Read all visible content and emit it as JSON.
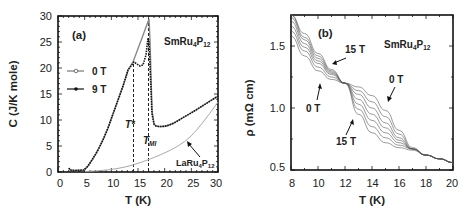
{
  "chart_data": [
    {
      "panel": "(a)",
      "type": "line",
      "xlabel": "T (K)",
      "ylabel": "C (J/K mole)",
      "xlim": [
        0,
        30
      ],
      "ylim": [
        0,
        30
      ],
      "xticks": [
        "0",
        "5",
        "10",
        "15",
        "20",
        "25",
        "30"
      ],
      "yticks": [
        "0",
        "5",
        "10",
        "15",
        "20",
        "25",
        "30"
      ],
      "grid": false,
      "legend_position": "upper-left",
      "compound_label": "SmRu4P12",
      "annotations": [
        "T*",
        "T_MI",
        "LaRu4P12"
      ],
      "vlines": [
        {
          "label": "T*",
          "x": 13.5
        },
        {
          "label": "T_MI",
          "x": 16.5
        }
      ],
      "series": [
        {
          "name": "0 T",
          "marker": "open-circle",
          "x": [
            2,
            3,
            4,
            5,
            6,
            7,
            8,
            9,
            10,
            11,
            12,
            13,
            14,
            15,
            16,
            16.5,
            17,
            18,
            20,
            22,
            24,
            26,
            28,
            30
          ],
          "y": [
            0.8,
            0.6,
            0.6,
            0.8,
            2,
            3.8,
            6,
            8.5,
            11.5,
            15,
            18,
            21,
            23.5,
            26,
            28.5,
            29.5,
            10,
            9,
            10,
            11.5,
            13,
            14.8,
            16.5,
            18.5
          ]
        },
        {
          "name": "9 T",
          "marker": "filled-circle",
          "x": [
            2,
            3,
            4,
            5,
            6,
            7,
            8,
            9,
            10,
            11,
            12,
            13,
            13.5,
            14,
            15,
            16,
            16.5,
            17,
            18,
            20,
            22,
            24,
            26,
            28,
            30
          ],
          "y": [
            0.8,
            0.6,
            0.6,
            0.8,
            2,
            3.8,
            6,
            8.5,
            11.5,
            15,
            18,
            21,
            22,
            21.5,
            21,
            23,
            26.5,
            10,
            9,
            10,
            11.5,
            13,
            14.8,
            16.5,
            18.5
          ]
        },
        {
          "name": "LaRu4P12",
          "marker": "none",
          "x": [
            5,
            10,
            15,
            20,
            25,
            30
          ],
          "y": [
            0.1,
            0.7,
            2.2,
            4.6,
            8.4,
            13.5
          ]
        }
      ]
    },
    {
      "panel": "(b)",
      "type": "line",
      "xlabel": "T (K)",
      "ylabel": "ρ (mΩ cm)",
      "xlim": [
        8,
        20
      ],
      "ylim": [
        0.5,
        1.75
      ],
      "xticks": [
        "8",
        "10",
        "12",
        "14",
        "16",
        "18",
        "20"
      ],
      "yticks": [
        "0.5",
        "1.0",
        "1.5"
      ],
      "grid": false,
      "compound_label": "SmRu4P12",
      "annotations": [
        "15 T",
        "0 T",
        "0 T",
        "15 T"
      ],
      "series_note": "Field sweep from 0 T to 15 T (7 curves)",
      "series": [
        {
          "name": "0 T",
          "x": [
            8,
            9,
            10,
            11,
            12,
            13,
            14,
            15,
            16,
            17,
            18,
            19,
            20
          ],
          "y": [
            1.58,
            1.42,
            1.3,
            1.23,
            1.2,
            1.17,
            1.1,
            0.98,
            0.82,
            0.68,
            0.62,
            0.59,
            0.56
          ]
        },
        {
          "name": "2.5 T",
          "x": [
            8,
            9,
            10,
            11,
            12,
            13,
            14,
            15,
            16,
            17,
            18,
            19,
            20
          ],
          "y": [
            1.62,
            1.46,
            1.33,
            1.25,
            1.2,
            1.14,
            1.05,
            0.93,
            0.79,
            0.67,
            0.62,
            0.59,
            0.56
          ]
        },
        {
          "name": "5 T",
          "x": [
            8,
            9,
            10,
            11,
            12,
            13,
            14,
            15,
            16,
            17,
            18,
            19,
            20
          ],
          "y": [
            1.66,
            1.49,
            1.36,
            1.27,
            1.2,
            1.11,
            1.0,
            0.88,
            0.76,
            0.67,
            0.62,
            0.59,
            0.56
          ]
        },
        {
          "name": "7.5 T",
          "x": [
            8,
            9,
            10,
            11,
            12,
            13,
            14,
            15,
            16,
            17,
            18,
            19,
            20
          ],
          "y": [
            1.7,
            1.52,
            1.38,
            1.28,
            1.2,
            1.07,
            0.95,
            0.84,
            0.74,
            0.67,
            0.62,
            0.59,
            0.56
          ]
        },
        {
          "name": "10 T",
          "x": [
            8,
            9,
            10,
            11,
            12,
            13,
            14,
            15,
            16,
            17,
            18,
            19,
            20
          ],
          "y": [
            1.73,
            1.55,
            1.4,
            1.29,
            1.2,
            1.03,
            0.9,
            0.8,
            0.72,
            0.67,
            0.62,
            0.59,
            0.56
          ]
        },
        {
          "name": "12.5 T",
          "x": [
            8,
            9,
            10,
            11,
            12,
            13,
            14,
            15,
            16,
            17,
            18,
            19,
            20
          ],
          "y": [
            1.76,
            1.57,
            1.42,
            1.3,
            1.2,
            0.99,
            0.85,
            0.76,
            0.7,
            0.67,
            0.62,
            0.59,
            0.56
          ]
        },
        {
          "name": "15 T",
          "x": [
            8,
            9,
            10,
            11,
            12,
            13,
            14,
            15,
            16,
            17,
            18,
            19,
            20
          ],
          "y": [
            1.79,
            1.6,
            1.44,
            1.31,
            1.2,
            0.95,
            0.8,
            0.72,
            0.68,
            0.66,
            0.62,
            0.59,
            0.56
          ]
        }
      ]
    }
  ],
  "panel_a": {
    "label": "(a)",
    "xlabel": "T (K)",
    "ylabel": "C (J/K mole)",
    "compound": "SmRu",
    "compound_sub1": "4",
    "compound_p": "P",
    "compound_sub2": "12",
    "legend": [
      "0 T",
      "9 T"
    ],
    "t_star": "T*",
    "t_mi": "T",
    "t_mi_sub": "MI",
    "la_label": "LaRu",
    "la_sub1": "4",
    "la_p": "P",
    "la_sub2": "12",
    "xticks": [
      "0",
      "5",
      "10",
      "15",
      "20",
      "25",
      "30"
    ],
    "yticks": [
      "0",
      "5",
      "10",
      "15",
      "20",
      "25",
      "30"
    ]
  },
  "panel_b": {
    "label": "(b)",
    "xlabel": "T (K)",
    "ylabel": "ρ (mΩ cm)",
    "compound": "SmRu",
    "compound_sub1": "4",
    "compound_p": "P",
    "compound_sub2": "12",
    "arrow_labels": [
      "15 T",
      "0 T",
      "0 T",
      "15 T"
    ],
    "xticks": [
      "8",
      "10",
      "12",
      "14",
      "16",
      "18",
      "20"
    ],
    "yticks": [
      "0.5",
      "1.0",
      "1.5"
    ]
  }
}
